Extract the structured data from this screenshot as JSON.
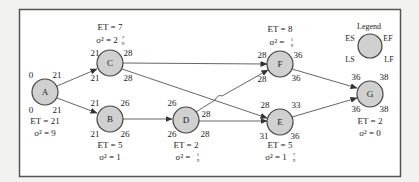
{
  "legend": {
    "title": "Legend",
    "es": "ES",
    "ef": "EF",
    "ls": "LS",
    "lf": "LF"
  },
  "colors": {
    "node_fill": "#d0d0d0",
    "node_stroke": "#444444",
    "frame": "#555555",
    "background": "#ffffff"
  },
  "nodes": {
    "A": {
      "name": "A",
      "es": "0",
      "ef": "21",
      "ls": "0",
      "lf": "21",
      "et": "ET = 21",
      "var": "σ² = 9"
    },
    "B": {
      "name": "B",
      "es": "21",
      "ef": "26",
      "ls": "21",
      "lf": "26",
      "et": "ET = 5",
      "var": "σ² = 1"
    },
    "C": {
      "name": "C",
      "es": "21",
      "ef": "28",
      "ls": "21",
      "lf": "28",
      "et": "ET = 7",
      "var_prefix": "σ² = 2",
      "var_frac_num": "7",
      "var_frac_den": "9"
    },
    "D": {
      "name": "D",
      "es": "26",
      "ef": "28",
      "ls": "26",
      "lf": "28",
      "et": "ET = 2",
      "var_prefix": "σ² = ",
      "var_frac_num": "1",
      "var_frac_den": "9"
    },
    "E": {
      "name": "E",
      "es": "28",
      "ef": "33",
      "ls": "31",
      "lf": "36",
      "et": "ET = 5",
      "var_prefix": "σ² = 1",
      "var_frac_num": "7",
      "var_frac_den": "9"
    },
    "F": {
      "name": "F",
      "es": "28",
      "ef": "36",
      "ls": "28",
      "lf": "36",
      "et": "ET = 8",
      "var_prefix": "σ² = ",
      "var_frac_num": "1",
      "var_frac_den": "9"
    },
    "G": {
      "name": "G",
      "es": "36",
      "ef": "38",
      "ls": "36",
      "lf": "38",
      "et": "ET = 2",
      "var": "σ² = 0"
    }
  },
  "edges": [
    {
      "from": "A",
      "to": "C"
    },
    {
      "from": "A",
      "to": "B"
    },
    {
      "from": "C",
      "to": "F"
    },
    {
      "from": "C",
      "to": "E"
    },
    {
      "from": "B",
      "to": "D"
    },
    {
      "from": "D",
      "to": "F"
    },
    {
      "from": "D",
      "to": "E"
    },
    {
      "from": "F",
      "to": "G"
    },
    {
      "from": "E",
      "to": "G"
    }
  ]
}
